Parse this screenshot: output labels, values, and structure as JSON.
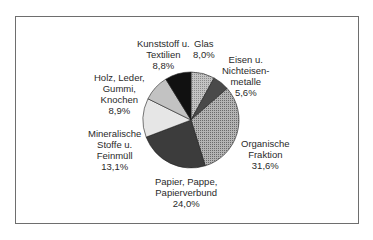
{
  "chart_data": {
    "type": "pie",
    "title": "",
    "start_angle_deg": 0,
    "direction": "clockwise",
    "slices": [
      {
        "label": "Glas",
        "value": 8.0,
        "display": "8,0%",
        "color": "#a8a8a8",
        "pattern": "dots"
      },
      {
        "label": "Eisen u. Nichteisenmetalle",
        "value": 5.6,
        "display": "5,6%",
        "color": "#4a4a4a",
        "pattern": "none"
      },
      {
        "label": "Organische Fraktion",
        "value": 31.6,
        "display": "31,6%",
        "color": "#9a9a9a",
        "pattern": "dots"
      },
      {
        "label": "Papier, Pappe, Papierverbund",
        "value": 24.0,
        "display": "24,0%",
        "color": "#3c3c3c",
        "pattern": "none"
      },
      {
        "label": "Mineralische Stoffe u. Feinmüll",
        "value": 13.1,
        "display": "13,1%",
        "color": "#e6e6e6",
        "pattern": "none"
      },
      {
        "label": "Holz, Leder, Gummi, Knochen",
        "value": 8.9,
        "display": "8,9%",
        "color": "#c2c2c2",
        "pattern": "none"
      },
      {
        "label": "Kunststoff u. Textilien",
        "value": 8.8,
        "display": "8,8%",
        "color": "#111111",
        "pattern": "none"
      }
    ],
    "legend": "none (labels placed around pie)"
  },
  "labels": {
    "glas": [
      "Glas",
      "8,0%"
    ],
    "eisen": [
      "Eisen u.",
      "Nichteisen-",
      "metalle",
      "5,6%"
    ],
    "organisch": [
      "Organische",
      "Fraktion",
      "31,6%"
    ],
    "papier": [
      "Papier, Pappe,",
      "Papierverbund",
      "24,0%"
    ],
    "mineral": [
      "Mineralische",
      "Stoffe u.",
      "Feinmüll",
      "13,1%"
    ],
    "holz": [
      "Holz, Leder,",
      "Gummi,",
      "Knochen",
      "8,9%"
    ],
    "kunststoff": [
      "Kunststoff u.",
      "Textilien",
      "8,8%"
    ]
  }
}
